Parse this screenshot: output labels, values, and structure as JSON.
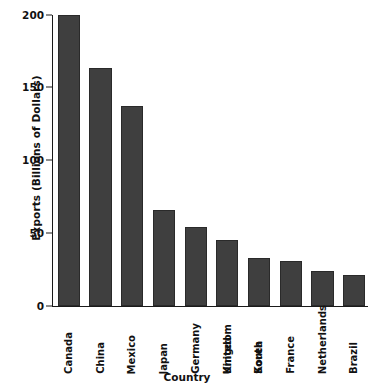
{
  "chart_data": {
    "type": "bar",
    "title": "",
    "xlabel": "Country",
    "ylabel": "Exports (Billions of Dollars)",
    "categories": [
      "Canada",
      "China",
      "Mexico",
      "Japan",
      "Germany",
      "United Kingdom",
      "South Korea",
      "France",
      "Netherlands",
      "Brazil"
    ],
    "values": [
      200,
      163,
      137,
      66,
      54,
      45,
      33,
      31,
      24,
      21
    ],
    "ylim": [
      0,
      200
    ],
    "yticks": [
      0,
      50,
      100,
      150,
      200
    ],
    "ytick_labels": [
      "0",
      "50",
      "100",
      "150",
      "200"
    ],
    "grid": false,
    "legend": false,
    "bar_color": "#3f3f3f",
    "axis_color": "#1a1a1a",
    "background_color": "#ffffff"
  },
  "axes": {
    "y_title": "Exports (Billions of Dollars)",
    "x_title": "Country"
  },
  "category_labels": [
    {
      "line1": "Canada",
      "line2": ""
    },
    {
      "line1": "China",
      "line2": ""
    },
    {
      "line1": "Mexico",
      "line2": ""
    },
    {
      "line1": "Japan",
      "line2": ""
    },
    {
      "line1": "Germany",
      "line2": ""
    },
    {
      "line1": "United",
      "line2": "Kingdom"
    },
    {
      "line1": "South",
      "line2": "Korea"
    },
    {
      "line1": "France",
      "line2": ""
    },
    {
      "line1": "Netherlands",
      "line2": ""
    },
    {
      "line1": "Brazil",
      "line2": ""
    }
  ]
}
